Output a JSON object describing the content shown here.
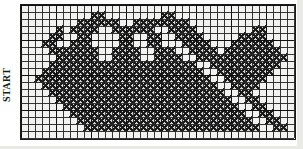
{
  "figure": {
    "kind": "cross-stitch-chart",
    "title_label": "START",
    "colors": {
      "stitch": "#1a1a1a",
      "grid_line": "#2b2b2b",
      "grid_major": "#111111",
      "background": "#f2f2f0",
      "page": "#ffffff"
    }
  },
  "chart_data": {
    "type": "heatmap",
    "title": "",
    "subtitle": "",
    "xlabel": "",
    "ylabel": "",
    "grid": true,
    "legend": "none",
    "annotations": [
      "START"
    ],
    "columns": 39,
    "rows": 19,
    "cell_size": 7,
    "major_every": 5,
    "value_meaning": {
      "1": "filled stitch (X)",
      "0": "empty mesh"
    },
    "rowlabels": [
      "1",
      "2",
      "3",
      "4",
      "5",
      "6",
      "7",
      "8",
      "9",
      "10",
      "11",
      "12",
      "13",
      "14",
      "15",
      "16",
      "17",
      "18",
      "19"
    ],
    "collabels": [
      "1",
      "2",
      "3",
      "4",
      "5",
      "6",
      "7",
      "8",
      "9",
      "10",
      "11",
      "12",
      "13",
      "14",
      "15",
      "16",
      "17",
      "18",
      "19",
      "20",
      "21",
      "22",
      "23",
      "24",
      "25",
      "26",
      "27",
      "28",
      "29",
      "30",
      "31",
      "32",
      "33",
      "34",
      "35",
      "36",
      "37",
      "38",
      "39"
    ],
    "cells": [
      "000000000000000000000000000000000000000",
      "000000000011000000001100000000000000000",
      "000000001111110011111111000000000000000",
      "000001011110011111100111100000000110000",
      "000011001100001100110011110000011110000",
      "000110011100001100110001111000111111000",
      "000011111110011110011100111101111111100",
      "000001111110011110011110011111111111110",
      "000011111111111111111111100111111111100",
      "000111111111111111111111110011111111000",
      "001111111111111111111111111001111110000",
      "000111111111111111111111111100111100000",
      "000011111111111111111111111110011000000",
      "000001111111111111111111111111001100000",
      "000000111111111111111111111111100110000",
      "000000011111111111111111111111110011000",
      "000000001111111111111111111111111001100",
      "000000000111111111111111111111111100110",
      "000000000000000000000000000000000000000"
    ],
    "motifs": [
      {
        "name": "large-heart-left",
        "center_col": 9,
        "center_row": 9
      },
      {
        "name": "large-heart-right",
        "center_col": 27,
        "center_row": 9
      },
      {
        "name": "small-heart-center",
        "center_col": 19,
        "center_row": 15
      },
      {
        "name": "paw-motif-top-left-outer",
        "center_col": 4,
        "center_row": 5
      },
      {
        "name": "paw-motif-top-left-inner",
        "center_col": 11,
        "center_row": 5
      },
      {
        "name": "paw-motif-top-right-inner",
        "center_col": 24,
        "center_row": 5
      },
      {
        "name": "paw-motif-top-right-outer",
        "center_col": 33,
        "center_row": 5
      }
    ]
  },
  "pattern": {
    "stitch_mark": "X",
    "rows": [
      {
        "y": 1,
        "runs": []
      },
      {
        "y": 2,
        "runs": [
          [
            22,
            3
          ],
          [
            23,
            3
          ]
        ]
      },
      {
        "y": 3,
        "runs": []
      }
    ]
  }
}
